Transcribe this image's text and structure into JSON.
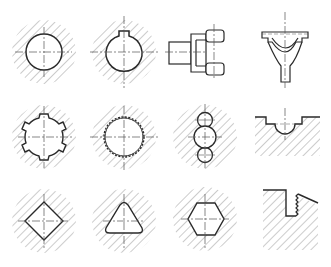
{
  "figure": {
    "title": "Cross-section shapes of holes and profiles in hatched material",
    "layout": {
      "rows": 3,
      "columns": 4
    },
    "colors": {
      "outline": "#2a2a2a",
      "hatch": "#9a9a9a",
      "centerline": "#555555",
      "background": "#ffffff"
    },
    "items": [
      {
        "row": 1,
        "col": 1,
        "label": "round-hole",
        "cx": 44,
        "cy": 52
      },
      {
        "row": 1,
        "col": 2,
        "label": "round-hole-with-keyway",
        "cx": 124,
        "cy": 52
      },
      {
        "row": 1,
        "col": 3,
        "label": "fork-yoke-on-shaft",
        "cx": 215,
        "cy": 52
      },
      {
        "row": 1,
        "col": 4,
        "label": "y-shaped-bracket",
        "cx": 286,
        "cy": 52
      },
      {
        "row": 2,
        "col": 1,
        "label": "splined-hole",
        "cx": 44,
        "cy": 137
      },
      {
        "row": 2,
        "col": 2,
        "label": "serrated-involute-hole",
        "cx": 124,
        "cy": 137
      },
      {
        "row": 2,
        "col": 3,
        "label": "triple-lobe-hole",
        "cx": 205,
        "cy": 137
      },
      {
        "row": 2,
        "col": 4,
        "label": "semicircular-groove",
        "cx": 286,
        "cy": 127
      },
      {
        "row": 3,
        "col": 1,
        "label": "square-hole",
        "cx": 44,
        "cy": 221
      },
      {
        "row": 3,
        "col": 2,
        "label": "triangular-hole",
        "cx": 124,
        "cy": 221
      },
      {
        "row": 3,
        "col": 3,
        "label": "hexagonal-hole",
        "cx": 205,
        "cy": 219
      },
      {
        "row": 3,
        "col": 4,
        "label": "threaded-step-profile",
        "cx": 290,
        "cy": 219
      }
    ]
  }
}
